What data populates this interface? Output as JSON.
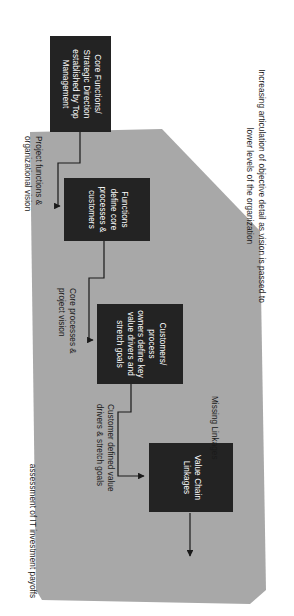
{
  "diagram": {
    "title_note": "Increasing articulation of objective detail as vision is passed to lower levels of the organization",
    "outcome_label": "assessment of IT investment payoffs",
    "colors": {
      "box_fill": "#232323",
      "box_text": "#ffffff",
      "polygon_fill": "#a8a8a8",
      "line": "#1a1a1a",
      "background": "#ffffff"
    },
    "boxes": [
      {
        "id": "core-functions",
        "lines": [
          "Core Functions/",
          "Strategic Direction",
          "established by Top",
          "Management"
        ],
        "text": "Core Functions/ Strategic Direction established by Top Management"
      },
      {
        "id": "functions-define",
        "lines": [
          "Functions",
          "define core",
          "processes &",
          "customers"
        ],
        "text": "Functions define core processes & customers"
      },
      {
        "id": "customers-process-owners",
        "lines": [
          "Customers/ process",
          "owners define key",
          "value drivers and",
          "stretch goals"
        ],
        "text": "Customers/ process owners define key value drivers and stretch goals"
      },
      {
        "id": "value-chain-linkages",
        "lines": [
          "Value Chain",
          "Linkages"
        ],
        "text": "Value Chain Linkages"
      }
    ],
    "connector_labels": [
      {
        "id": "project-functions",
        "lines": [
          "Project  functions &",
          "organizational  vision"
        ],
        "text": "Project functions & organizational vision"
      },
      {
        "id": "core-processes",
        "lines": [
          "Core processes &",
          "project vision"
        ],
        "text": "Core processes & project vision"
      },
      {
        "id": "customer-defined-value",
        "lines": [
          "Customer defined value",
          "drivers & stretch goals"
        ],
        "text": "Customer defined value drivers & stretch goals"
      },
      {
        "id": "missing-linkages",
        "lines": [
          "Missing Linkages"
        ],
        "text": "Missing Linkages"
      }
    ]
  }
}
